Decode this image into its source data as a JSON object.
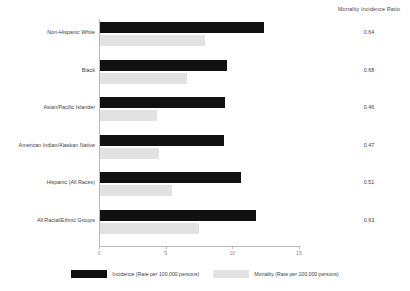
{
  "ratio_column": {
    "header": "Mortality Incidence Ratio",
    "values": [
      "0.64",
      "0.68",
      "0.46",
      "0.47",
      "0.51",
      "0.63"
    ]
  },
  "legend": {
    "incidence_label": "Incidence (Rate per 100,000 persons)",
    "mortality_label": "Mortality (Rate per 100,000 persons)"
  },
  "colors": {
    "incidence": "#111111",
    "mortality": "#e2e2e2",
    "axis": "#b9b9b9"
  },
  "chart_data": {
    "type": "bar",
    "orientation": "horizontal",
    "title": "",
    "xlabel": "",
    "ylabel": "",
    "xlim": [
      0,
      15
    ],
    "xticks": [
      0,
      5,
      10,
      15
    ],
    "xtick_labels": [
      "0",
      "5",
      "10",
      "15"
    ],
    "grid": false,
    "legend_position": "bottom",
    "categories": [
      "Non-Hispanic White",
      "Black",
      "Asian/Pacific Islander",
      "American Indian/Alaskan Native",
      "Hispanic (All Races)",
      "All Racial/Ethnic Groups"
    ],
    "series": [
      {
        "name": "Incidence (Rate per 100,000 persons)",
        "values": [
          12.3,
          9.5,
          9.4,
          9.3,
          10.6,
          11.7
        ]
      },
      {
        "name": "Mortality (Rate per 100,000 persons)",
        "values": [
          7.9,
          6.5,
          4.3,
          4.4,
          5.4,
          7.4
        ]
      }
    ],
    "annotations": {
      "label": "Mortality Incidence Ratio",
      "values": [
        0.64,
        0.68,
        0.46,
        0.47,
        0.51,
        0.63
      ]
    }
  }
}
